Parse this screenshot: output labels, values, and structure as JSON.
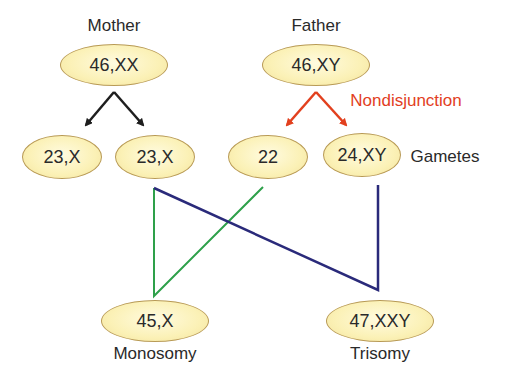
{
  "colors": {
    "meiosis_arrow": "#1e1e1e",
    "nondisjunction_arrow": "#e2401e",
    "green_line": "#2ea04a",
    "navy_line": "#2a2a7a",
    "oval_fill": "#fbf1b6",
    "oval_border": "#b89a55"
  },
  "parents": {
    "mother": {
      "label": "Mother",
      "karyotype": "46,XX"
    },
    "father": {
      "label": "Father",
      "karyotype": "46,XY"
    }
  },
  "annotation": {
    "nondisjunction": "Nondisjunction"
  },
  "gametes": {
    "label": "Gametes",
    "items": [
      "23,X",
      "23,X",
      "22",
      "24,XY"
    ]
  },
  "offspring": [
    {
      "karyotype": "45,X",
      "label": "Monosomy"
    },
    {
      "karyotype": "47,XXY",
      "label": "Trisomy"
    }
  ]
}
